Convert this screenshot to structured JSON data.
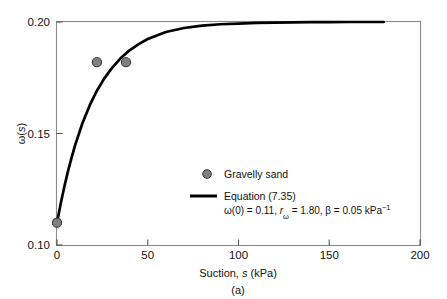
{
  "figure": {
    "caption": "(a)",
    "background": "#ffffff"
  },
  "chart_data": {
    "type": "scatter",
    "title": "",
    "xlabel_parts": {
      "main": "Suction, ",
      "symbol": "s",
      "unit": " (kPa)"
    },
    "xlabel": "Suction, s (kPa)",
    "ylabel": "ω(s)",
    "ylabel_parts": {
      "symbol": "ω(",
      "italic": "s",
      "close": ")"
    },
    "xlim": [
      0,
      200
    ],
    "ylim": [
      0.1,
      0.2
    ],
    "xticks": [
      0,
      50,
      100,
      150,
      200
    ],
    "xtick_labels": [
      "0",
      "50",
      "100",
      "150",
      "200"
    ],
    "yticks": [
      0.1,
      0.15,
      0.2
    ],
    "ytick_labels": [
      "0.10",
      "0.15",
      "0.20"
    ],
    "grid": false,
    "legend_position": "center-right",
    "series": [
      {
        "name": "Gravelly sand",
        "kind": "scatter",
        "marker": "circle",
        "color": "#808080",
        "edge_color": "#3a3a3a",
        "x": [
          0,
          22,
          38
        ],
        "y": [
          0.11,
          0.182,
          0.182
        ]
      },
      {
        "name": "Equation (7.35)",
        "kind": "line",
        "color": "#000000",
        "line_width": 2.6,
        "x_range": [
          0,
          180
        ],
        "model": {
          "omega_0": 0.11,
          "omega_inf": 0.2,
          "r_omega": 1.8,
          "beta": 0.05,
          "beta_unit": "kPa^-1"
        },
        "x": [
          0,
          2,
          4,
          6,
          8,
          10,
          14,
          18,
          22,
          26,
          30,
          35,
          40,
          45,
          50,
          60,
          70,
          80,
          90,
          100,
          110,
          120,
          130,
          140,
          150,
          160,
          170,
          180
        ],
        "y": [
          0.11,
          0.1184,
          0.126,
          0.1329,
          0.1391,
          0.1448,
          0.1546,
          0.1626,
          0.1692,
          0.1746,
          0.1791,
          0.1837,
          0.1873,
          0.1901,
          0.1924,
          0.1955,
          0.1973,
          0.1984,
          0.199,
          0.1993,
          0.1996,
          0.1997,
          0.1998,
          0.1999,
          0.1999,
          0.2,
          0.2,
          0.2
        ]
      }
    ],
    "annotations": {
      "equation_params": "ω(0) = 0.11, rω = 1.80, β = 0.05 kPa⁻¹",
      "param_omega0": "ω(0) = 0.11,",
      "param_r": "r",
      "param_r_sub": "ω",
      "param_r_val": " = 1.80,",
      "param_beta": "β = 0.05 kPa",
      "param_beta_sup": "−1"
    }
  },
  "legend": {
    "entries": [
      {
        "label": "Gravelly sand",
        "type": "marker"
      },
      {
        "label": "Equation (7.35)",
        "type": "line"
      }
    ]
  }
}
